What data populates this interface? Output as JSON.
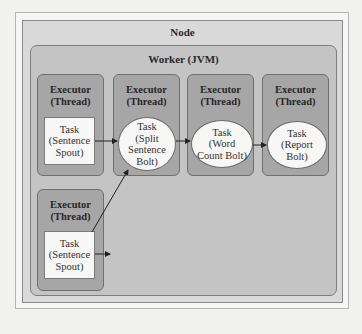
{
  "diagram": {
    "node": {
      "title": "Node"
    },
    "worker": {
      "title": "Worker (JVM)"
    },
    "executors": [
      {
        "title": "Executor\n(Thread)",
        "task": "Task\n(Sentence\nSpout)",
        "task_shape": "rectangle"
      },
      {
        "title": "Executor\n(Thread)",
        "task": "Task\n(Split\nSentence\nBolt)",
        "task_shape": "ellipse"
      },
      {
        "title": "Executor\n(Thread)",
        "task": "Task\n(Word\nCount Bolt)",
        "task_shape": "ellipse"
      },
      {
        "title": "Executor\n(Thread)",
        "task": "Task\n(Report\nBolt)",
        "task_shape": "ellipse"
      },
      {
        "title": "Executor\n(Thread)",
        "task": "Task\n(Sentence\nSpout)",
        "task_shape": "rectangle"
      }
    ],
    "edges": [
      {
        "from": "Task (Sentence Spout) #1",
        "to": "Task (Split Sentence Bolt)"
      },
      {
        "from": "Task (Split Sentence Bolt)",
        "to": "Task (Word Count Bolt)"
      },
      {
        "from": "Task (Word Count Bolt)",
        "to": "Task (Report Bolt)"
      },
      {
        "from": "Task (Sentence Spout) #2",
        "to": "Task (Split Sentence Bolt)"
      }
    ],
    "colors": {
      "node_fill": "#d9d9d9",
      "worker_fill": "#c4c4c4",
      "executor_fill": "#a6a6a6",
      "task_fill": "#f7f7f5"
    }
  }
}
